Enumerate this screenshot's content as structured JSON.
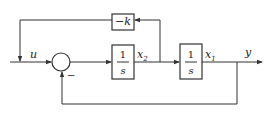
{
  "diagram": {
    "type": "block-diagram",
    "signals": {
      "input": "u",
      "output": "y",
      "x1": {
        "base": "x",
        "sub": "1"
      },
      "x2": {
        "base": "x",
        "sub": "2"
      }
    },
    "blocks": {
      "gain": {
        "label": "−k"
      },
      "integrator1": {
        "num": "1",
        "den": "s"
      },
      "integrator2": {
        "num": "1",
        "den": "s"
      }
    },
    "summing_junction": {
      "minus_sign": "−"
    }
  }
}
